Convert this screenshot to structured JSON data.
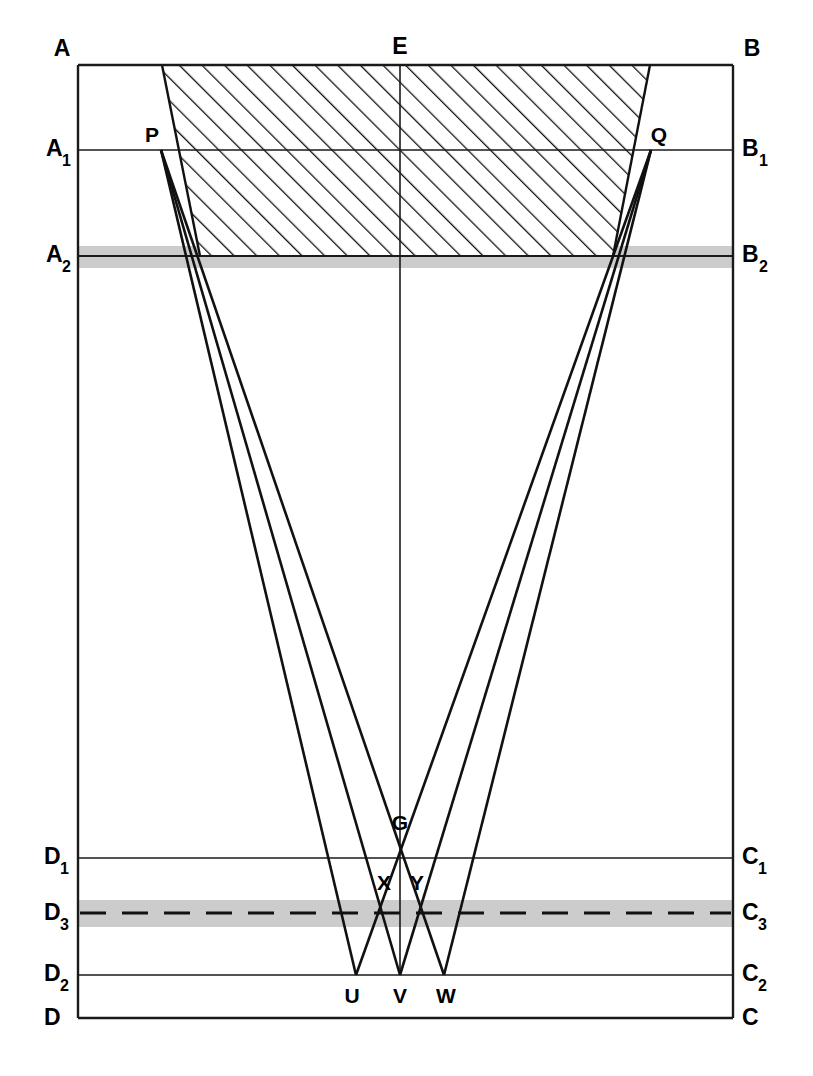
{
  "figure": {
    "kind": "optical-ray-diagram",
    "background_color": "#ffffff",
    "ink_color": "#111111",
    "band_color": "#b9b9b9",
    "width": 813,
    "height": 1076
  },
  "labels": {
    "corner_top_left": "A",
    "corner_top_right": "B",
    "corner_bottom_left": "D",
    "corner_bottom_right": "C",
    "top_center": "E",
    "left_1": "A",
    "left_1_sub": "1",
    "left_2": "A",
    "left_2_sub": "2",
    "right_1": "B",
    "right_1_sub": "1",
    "right_2": "B",
    "right_2_sub": "2",
    "left_d1": "D",
    "left_d1_sub": "1",
    "left_d3": "D",
    "left_d3_sub": "3",
    "left_d2": "D",
    "left_d2_sub": "2",
    "right_c1": "C",
    "right_c1_sub": "1",
    "right_c3": "C",
    "right_c3_sub": "3",
    "right_c2": "C",
    "right_c2_sub": "2",
    "aperture_left": "P",
    "aperture_right": "Q",
    "focus": "G",
    "cross_left": "X",
    "cross_right": "Y",
    "base_left": "U",
    "base_center": "V",
    "base_right": "W"
  },
  "geometry": {
    "frame": {
      "left": 78,
      "right": 733,
      "top": 65,
      "bottom": 1018
    },
    "horizontal_lines": [
      {
        "name": "AB",
        "y": 65
      },
      {
        "name": "A1B1",
        "y": 150
      },
      {
        "name": "A2B2",
        "y": 256
      },
      {
        "name": "D1C1",
        "y": 858
      },
      {
        "name": "D3C3",
        "y": 913
      },
      {
        "name": "D2C2",
        "y": 975
      },
      {
        "name": "DC",
        "y": 1018
      }
    ],
    "bands": [
      {
        "name": "A2B2-band",
        "y": 246,
        "height": 22
      },
      {
        "name": "D3C3-band",
        "y": 901,
        "height": 26
      }
    ],
    "points": {
      "E": {
        "x": 400,
        "y": 65
      },
      "P": {
        "x": 161,
        "y": 150
      },
      "Q": {
        "x": 651,
        "y": 150
      },
      "G": {
        "x": 400,
        "y": 858
      },
      "X": {
        "x": 385,
        "y": 888
      },
      "Y": {
        "x": 416,
        "y": 888
      },
      "U": {
        "x": 356,
        "y": 975
      },
      "V": {
        "x": 400,
        "y": 975
      },
      "W": {
        "x": 444,
        "y": 975
      }
    },
    "hatch_region": {
      "top_left": {
        "x": 162,
        "y": 65
      },
      "top_right": {
        "x": 650,
        "y": 65
      },
      "bottom_right": {
        "x": 613,
        "y": 256
      },
      "bottom_left": {
        "x": 200,
        "y": 256
      },
      "hatch_angle_deg": 45,
      "hatch_spacing_px": 16
    },
    "rays_from_P": [
      {
        "from": "P",
        "to": "U"
      },
      {
        "from": "P",
        "to": "V"
      },
      {
        "from": "P",
        "to": "W"
      }
    ],
    "rays_from_Q": [
      {
        "from": "Q",
        "to": "U"
      },
      {
        "from": "Q",
        "to": "V"
      },
      {
        "from": "Q",
        "to": "W"
      }
    ],
    "axis": {
      "from": "E",
      "to": "V"
    }
  }
}
